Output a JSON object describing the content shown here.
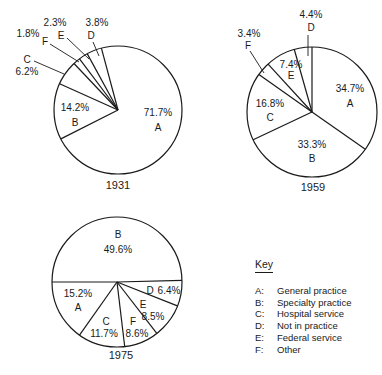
{
  "chart_data": [
    {
      "type": "pie",
      "title": "1931",
      "start_angle_deg": 345,
      "slices": [
        {
          "code": "A",
          "label": "General practice",
          "value": 71.7,
          "text": "71.7%"
        },
        {
          "code": "B",
          "label": "Specialty practice",
          "value": 14.2,
          "text": "14.2%"
        },
        {
          "code": "C",
          "label": "Hospital service",
          "value": 6.2,
          "text": "6.2%"
        },
        {
          "code": "F",
          "label": "Other",
          "value": 1.8,
          "text": "1.8%"
        },
        {
          "code": "E",
          "label": "Federal service",
          "value": 2.3,
          "text": "2.3%"
        },
        {
          "code": "D",
          "label": "Not in practice",
          "value": 3.8,
          "text": "3.8%"
        }
      ]
    },
    {
      "type": "pie",
      "title": "1959",
      "start_angle_deg": 0,
      "slices": [
        {
          "code": "A",
          "label": "General practice",
          "value": 34.7,
          "text": "34.7%"
        },
        {
          "code": "B",
          "label": "Specialty practice",
          "value": 33.3,
          "text": "33.3%"
        },
        {
          "code": "C",
          "label": "Hospital service",
          "value": 16.8,
          "text": "16.8%"
        },
        {
          "code": "F",
          "label": "Other",
          "value": 3.4,
          "text": "3.4%"
        },
        {
          "code": "E",
          "label": "Federal service",
          "value": 7.4,
          "text": "7.4%"
        },
        {
          "code": "D",
          "label": "Not in practice",
          "value": 4.4,
          "text": "4.4%"
        }
      ]
    },
    {
      "type": "pie",
      "title": "1975",
      "start_angle_deg": 270,
      "slices": [
        {
          "code": "B",
          "label": "Specialty practice",
          "value": 49.6,
          "text": "49.6%"
        },
        {
          "code": "D",
          "label": "Not in practice",
          "value": 6.4,
          "text": "6.4%"
        },
        {
          "code": "E",
          "label": "Federal service",
          "value": 8.5,
          "text": "8.5%"
        },
        {
          "code": "F",
          "label": "Other",
          "value": 8.6,
          "text": "8.6%"
        },
        {
          "code": "C",
          "label": "Hospital service",
          "value": 11.7,
          "text": "11.7%"
        },
        {
          "code": "A",
          "label": "General practice",
          "value": 15.2,
          "text": "15.2%"
        }
      ]
    }
  ],
  "key": {
    "title": "Key",
    "items": [
      {
        "code": "A:",
        "label": "General practice"
      },
      {
        "code": "B:",
        "label": "Specialty practice"
      },
      {
        "code": "C:",
        "label": "Hospital service"
      },
      {
        "code": "D:",
        "label": "Not in practice"
      },
      {
        "code": "E:",
        "label": "Federal service"
      },
      {
        "code": "F:",
        "label": "Other"
      }
    ]
  },
  "colors": {
    "stroke": "#1a1a1a",
    "fill": "#ffffff"
  }
}
